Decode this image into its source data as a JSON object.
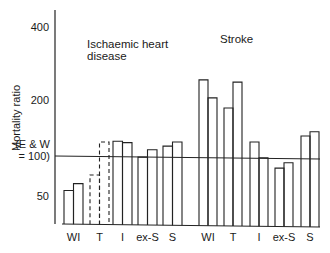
{
  "chart_data": {
    "type": "bar",
    "scale": "log",
    "ylabel": "Mortality ratio",
    "yticks": [
      {
        "value": 400,
        "label": "400"
      },
      {
        "value": 200,
        "label": "200"
      },
      {
        "value": 100,
        "label_lines": [
          "(E & W",
          "= 100)"
        ]
      },
      {
        "value": 50,
        "label": "50"
      }
    ],
    "ylim": [
      40,
      450
    ],
    "reference_line": 100,
    "panels": [
      {
        "title_lines": [
          "Ischaemic heart",
          "disease"
        ],
        "categories": [
          "WI",
          "T",
          "I",
          "ex-S",
          "S"
        ],
        "values": [
          [
            55,
            62
          ],
          [
            72,
            119
          ],
          [
            120,
            118
          ],
          [
            98,
            108
          ],
          [
            113,
            119
          ]
        ],
        "dashed_categories": [
          "T"
        ]
      },
      {
        "title_lines": [
          "Stroke"
        ],
        "categories": [
          "WI",
          "T",
          "I",
          "ex-S",
          "S"
        ],
        "values": [
          [
            242,
            204
          ],
          [
            181,
            237
          ],
          [
            119,
            97
          ],
          [
            81,
            89
          ],
          [
            128,
            135
          ]
        ],
        "dashed_categories": []
      }
    ]
  }
}
